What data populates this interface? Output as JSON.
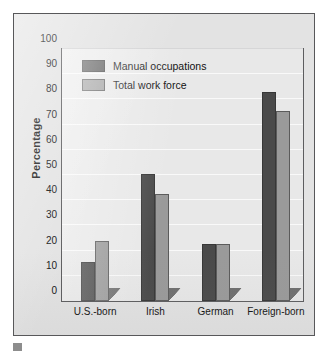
{
  "chart_data": {
    "type": "bar",
    "title": "",
    "xlabel": "",
    "ylabel": "Percentage",
    "ylim": [
      0,
      100
    ],
    "ytick_step": 10,
    "yticks": [
      100,
      90,
      80,
      70,
      60,
      50,
      40,
      30,
      20,
      10,
      0
    ],
    "grid": true,
    "legend_position": "top-left inside plot",
    "categories": [
      "U.S.-born",
      "Irish",
      "German",
      "Foreign-born"
    ],
    "series": [
      {
        "name": "Manual occupations",
        "color": "#4a4a4a",
        "values": [
          15.5,
          50.5,
          22.5,
          83.0
        ]
      },
      {
        "name": "Total work force",
        "color": "#9a9a9a",
        "values": [
          24.0,
          42.5,
          22.5,
          75.5
        ]
      }
    ]
  },
  "legend": {
    "items": [
      {
        "label": "Manual occupations",
        "color": "#4a4a4a"
      },
      {
        "label": "Total work force",
        "color": "#9a9a9a"
      }
    ]
  },
  "caption": {
    "fragment": ""
  }
}
